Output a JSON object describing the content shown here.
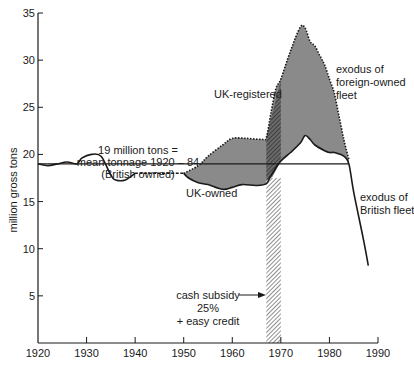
{
  "chart_data": {
    "type": "area",
    "title": "",
    "xlabel": "",
    "ylabel": "million gross tons",
    "xlim": [
      1920,
      1990
    ],
    "ylim": [
      0,
      35
    ],
    "x_ticks": [
      "1920",
      "1930",
      "1940",
      "1950",
      "1960",
      "1970",
      "1980",
      "1990"
    ],
    "y_ticks": [
      "5",
      "10",
      "15",
      "20",
      "25",
      "30",
      "35"
    ],
    "grid": false,
    "legend": "none (inline annotations)",
    "series": [
      {
        "name": "UK-owned (British owned fleet)",
        "style": "solid line (dashed 1940-1950)",
        "x": [
          1920,
          1922,
          1924,
          1926,
          1928,
          1929,
          1931,
          1933,
          1935,
          1936,
          1938,
          1940,
          1945,
          1950,
          1951,
          1953,
          1955,
          1958,
          1960,
          1962,
          1965,
          1967,
          1968,
          1970,
          1972,
          1974,
          1975,
          1976,
          1977,
          1979,
          1980,
          1981,
          1983,
          1984,
          1985,
          1987,
          1988
        ],
        "values": [
          19.0,
          18.8,
          19.0,
          19.2,
          19.0,
          19.6,
          20.0,
          19.8,
          17.8,
          17.3,
          17.3,
          18.0,
          18.0,
          18.0,
          17.5,
          17.0,
          16.8,
          16.3,
          16.5,
          16.8,
          16.7,
          16.9,
          17.8,
          19.3,
          20.2,
          21.2,
          22.0,
          21.6,
          21.0,
          20.4,
          20.2,
          20.2,
          19.8,
          19.0,
          16.0,
          11.0,
          8.2
        ]
      },
      {
        "name": "UK-registered",
        "style": "dotted line",
        "x": [
          1950,
          1953,
          1955,
          1958,
          1960,
          1963,
          1966,
          1967,
          1968,
          1969,
          1970,
          1972,
          1974,
          1975,
          1976,
          1977,
          1978,
          1979,
          1980,
          1981,
          1982,
          1983,
          1984
        ],
        "values": [
          18.0,
          18.8,
          19.8,
          21.0,
          21.7,
          21.7,
          21.6,
          21.8,
          24.5,
          27.0,
          28.0,
          31.0,
          33.5,
          33.4,
          32.0,
          31.5,
          30.5,
          29.5,
          28.0,
          26.5,
          24.0,
          21.5,
          19.5
        ]
      },
      {
        "name": "mean tonnage 1920-84 (British owned)",
        "style": "horizontal reference line",
        "x": [
          1920,
          1984
        ],
        "values": [
          19,
          19
        ]
      }
    ],
    "shaded_regions": [
      {
        "name": "UK-registered minus UK-owned",
        "fill": "#8a8a8a",
        "x_range": [
          1950,
          1984
        ]
      },
      {
        "name": "cash subsidy period",
        "fill": "hatched",
        "x_range": [
          1967,
          1970
        ]
      }
    ],
    "annotations": [
      {
        "text": "19 million tons =",
        "x": 1937,
        "y": 20.8
      },
      {
        "text": "mean tonnage 1920 – 84",
        "x": 1937,
        "y": 19.9
      },
      {
        "text": "(British owned)",
        "x": 1937,
        "y": 19.0
      },
      {
        "text": "UK-registered",
        "x": 1962,
        "y": 23.8
      },
      {
        "text": "UK-owned",
        "x": 1955,
        "y": 15.7
      },
      {
        "text": "exodus of",
        "x": 1985,
        "y": 29.6
      },
      {
        "text": "foreign-owned",
        "x": 1985,
        "y": 28.3
      },
      {
        "text": "fleet",
        "x": 1985,
        "y": 27.0
      },
      {
        "text": "exodus of",
        "x": 1987,
        "y": 14.0
      },
      {
        "text": "British fleet",
        "x": 1987,
        "y": 12.7
      },
      {
        "text": "cash subsidy",
        "x": 1959,
        "y": 5.4
      },
      {
        "text": "25%",
        "x": 1959,
        "y": 4.1
      },
      {
        "text": "+ easy credit",
        "x": 1959,
        "y": 2.8
      }
    ]
  },
  "labels": {
    "ylabel": "million gross tons",
    "x_ticks": [
      "1920",
      "1930",
      "1940",
      "1950",
      "1960",
      "1970",
      "1980",
      "1990"
    ],
    "y_ticks": [
      "5",
      "10",
      "15",
      "20",
      "25",
      "30",
      "35"
    ],
    "mean_line_1": "19 million tons =",
    "mean_line_2": "mean tonnage 1920 – 84",
    "mean_line_3": "(British owned)",
    "uk_registered": "UK-registered",
    "uk_owned": "UK-owned",
    "exodus_foreign_1": "exodus of",
    "exodus_foreign_2": "foreign-owned",
    "exodus_foreign_3": "fleet",
    "exodus_british_1": "exodus of",
    "exodus_british_2": "British fleet",
    "subsidy_1": "cash subsidy",
    "subsidy_2": "25%",
    "subsidy_3": "+ easy credit"
  },
  "colors": {
    "fill_gap": "#8a8a8a",
    "line": "#1a1a1a",
    "background": "#ffffff"
  }
}
